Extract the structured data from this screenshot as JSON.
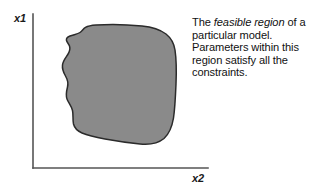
{
  "figure": {
    "name": "feasible-region-diagram",
    "background_color": "#ffffff"
  },
  "axes": {
    "y_axis_label": "x1",
    "x_axis_label": "x2",
    "line_color": "#555555",
    "origin_x": 33,
    "origin_y": 168,
    "y_axis_top": 14,
    "x_axis_right": 208
  },
  "region": {
    "label": "feasible-region",
    "fill_color": "#8a8a8a",
    "stroke_color": "#2b2b2b",
    "bounds": {
      "left": 62,
      "top": 25,
      "right": 176,
      "bottom": 144
    }
  },
  "caption": {
    "line1_prefix": "The ",
    "line1_emphasis": "feasible region",
    "rest": " of a particular model. Parameters within this region satisfy all the constraints.",
    "full_text": "The feasible region of a particular model. Parameters within this region satisfy all the constraints."
  }
}
